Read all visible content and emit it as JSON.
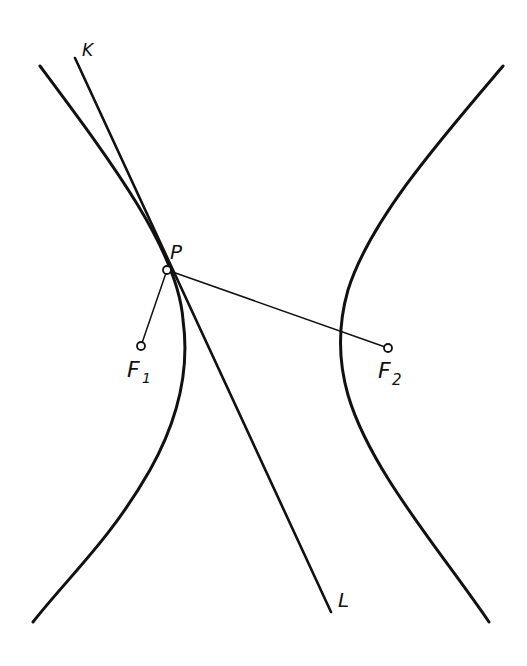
{
  "figure": {
    "labels": {
      "K": "K",
      "L": "L",
      "P": "P",
      "F1": "F",
      "F1_sub": "1",
      "F2": "F",
      "F2_sub": "2"
    },
    "colors": {
      "ink": "#111111",
      "background": "#ffffff"
    }
  }
}
